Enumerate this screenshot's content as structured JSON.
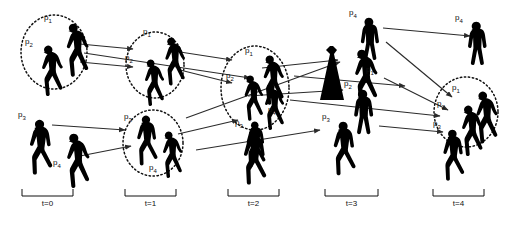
{
  "figure": {
    "type": "tracking-diagram",
    "background_color": "#ffffff",
    "silhouette_color": "#000000",
    "circle_style": "dotted",
    "arrow_color": "#2b2b2b"
  },
  "timesteps": [
    {
      "id": "t0",
      "label": "t=0",
      "bracket": {
        "x1": 22,
        "x2": 73,
        "y": 196
      },
      "label_x": 47,
      "label_y": 205
    },
    {
      "id": "t1",
      "label": "t=1",
      "bracket": {
        "x1": 125,
        "x2": 176,
        "y": 196
      },
      "label_x": 150,
      "label_y": 205
    },
    {
      "id": "t2",
      "label": "t=2",
      "bracket": {
        "x1": 228,
        "x2": 279,
        "y": 196
      },
      "label_x": 253,
      "label_y": 205
    },
    {
      "id": "t3",
      "label": "t=3",
      "bracket": {
        "x1": 325,
        "x2": 378,
        "y": 196
      },
      "label_x": 351,
      "label_y": 205
    },
    {
      "id": "t4",
      "label": "t=4",
      "bracket": {
        "x1": 433,
        "x2": 484,
        "y": 196
      },
      "label_x": 458,
      "label_y": 205
    }
  ],
  "person_labels": [
    {
      "id": "t0-p1",
      "text": "p",
      "sub": "1",
      "x": 47,
      "y": 18
    },
    {
      "id": "t0-p2",
      "text": "p",
      "sub": "2",
      "x": 28,
      "y": 42
    },
    {
      "id": "t0-p3",
      "text": "p",
      "sub": "3",
      "x": 21,
      "y": 115
    },
    {
      "id": "t0-p4",
      "text": "p",
      "sub": "4",
      "x": 56,
      "y": 163
    },
    {
      "id": "t1-p1",
      "text": "p",
      "sub": "1",
      "x": 146,
      "y": 32
    },
    {
      "id": "t1-p2",
      "text": "p",
      "sub": "2",
      "x": 128,
      "y": 58
    },
    {
      "id": "t1-p3",
      "text": "p",
      "sub": "3",
      "x": 127,
      "y": 117
    },
    {
      "id": "t1-p4",
      "text": "p",
      "sub": "4",
      "x": 152,
      "y": 168
    },
    {
      "id": "t2-p1",
      "text": "p",
      "sub": "1",
      "x": 248,
      "y": 51
    },
    {
      "id": "t2-p2",
      "text": "p",
      "sub": "2",
      "x": 229,
      "y": 76
    },
    {
      "id": "t2-p4",
      "text": "p",
      "sub": "4",
      "x": 271,
      "y": 110
    },
    {
      "id": "t2-p3",
      "text": "p",
      "sub": "3",
      "x": 238,
      "y": 123
    },
    {
      "id": "t3-p4",
      "text": "p",
      "sub": "4",
      "x": 352,
      "y": 13
    },
    {
      "id": "t3-p1",
      "text": "p",
      "sub": "1",
      "x": 369,
      "y": 70
    },
    {
      "id": "t3-p2",
      "text": "p",
      "sub": "2",
      "x": 347,
      "y": 84
    },
    {
      "id": "t3-p3",
      "text": "p",
      "sub": "3",
      "x": 325,
      "y": 117
    },
    {
      "id": "t4-p4",
      "text": "p",
      "sub": "4",
      "x": 458,
      "y": 18
    },
    {
      "id": "t4-p1",
      "text": "p",
      "sub": "1",
      "x": 455,
      "y": 88
    },
    {
      "id": "t4-p2",
      "text": "p",
      "sub": "2",
      "x": 440,
      "y": 104
    },
    {
      "id": "t4-p3",
      "text": "p",
      "sub": "3",
      "x": 436,
      "y": 124
    }
  ],
  "groups": [
    {
      "id": "group-t0-p1p2",
      "cx": 54,
      "cy": 52,
      "rx": 33,
      "ry": 37,
      "members": [
        "p1",
        "p2"
      ]
    },
    {
      "id": "group-t1-p1p2",
      "cx": 155,
      "cy": 65,
      "rx": 29,
      "ry": 33,
      "members": [
        "p1",
        "p2"
      ]
    },
    {
      "id": "group-t1-p3p4",
      "cx": 153,
      "cy": 143,
      "rx": 30,
      "ry": 33,
      "members": [
        "p3",
        "p4"
      ]
    },
    {
      "id": "group-t2-all",
      "cx": 255,
      "cy": 88,
      "rx": 34,
      "ry": 42,
      "members": [
        "p1",
        "p2",
        "p3",
        "p4"
      ]
    },
    {
      "id": "group-t4-p1p2p3",
      "cx": 466,
      "cy": 112,
      "rx": 32,
      "ry": 35,
      "members": [
        "p1",
        "p2",
        "p3"
      ]
    }
  ],
  "tracks": [
    {
      "id": "track-t0p1-t1p1",
      "from": "t0",
      "to": "t1"
    },
    {
      "id": "track-t0p2-t1p2",
      "from": "t0",
      "to": "t1"
    },
    {
      "id": "track-t0p3-t1p3",
      "from": "t0",
      "to": "t1"
    },
    {
      "id": "track-t0p4-t1p4",
      "from": "t0",
      "to": "t1"
    },
    {
      "id": "track-t1-t2-a",
      "from": "t1",
      "to": "t2"
    },
    {
      "id": "track-t1-t2-b",
      "from": "t1",
      "to": "t2"
    },
    {
      "id": "track-t1-t2-c",
      "from": "t1",
      "to": "t2"
    },
    {
      "id": "track-t2-t3-a",
      "from": "t2",
      "to": "t3"
    },
    {
      "id": "track-t2-t3-b",
      "from": "t2",
      "to": "t3"
    },
    {
      "id": "track-t2-t3-c",
      "from": "t2",
      "to": "t3"
    },
    {
      "id": "track-t3-t4-a",
      "from": "t3",
      "to": "t4"
    },
    {
      "id": "track-t3-t4-b",
      "from": "t3",
      "to": "t4"
    },
    {
      "id": "track-t3-t4-c",
      "from": "t3",
      "to": "t4"
    }
  ]
}
